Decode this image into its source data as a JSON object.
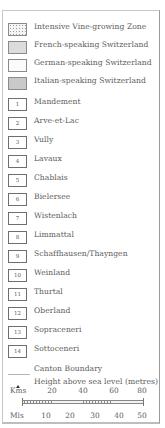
{
  "legend": {
    "zones": [
      {
        "label": "Intensive Vine-growing Zone",
        "style": "dotted"
      },
      {
        "label": "French-speaking Switzerland",
        "style": "french"
      },
      {
        "label": "German-speaking Switzerland",
        "style": "german"
      },
      {
        "label": "Italian-speaking Switzerland",
        "style": "italian"
      }
    ],
    "regions": [
      {
        "number": "1",
        "label": "Mandement"
      },
      {
        "number": "2",
        "label": "Arve-et-Lac"
      },
      {
        "number": "3",
        "label": "Vully"
      },
      {
        "number": "4",
        "label": "Lavaux"
      },
      {
        "number": "5",
        "label": "Chablais"
      },
      {
        "number": "6",
        "label": "Bielersee"
      },
      {
        "number": "7",
        "label": "Wistenlach"
      },
      {
        "number": "8",
        "label": "Limmattal"
      },
      {
        "number": "9",
        "label": "Schaffhausen/Thayngen"
      },
      {
        "number": "10",
        "label": "Weinland"
      },
      {
        "number": "11",
        "label": "Thurtal"
      },
      {
        "number": "12",
        "label": "Oberland"
      },
      {
        "number": "13",
        "label": "Sopraceneri"
      },
      {
        "number": "14",
        "label": "Sottoceneri"
      }
    ],
    "symbols": {
      "canton_boundary": "Canton Boundary",
      "height": "Height above sea level (metres)"
    },
    "scale": {
      "kms_label": "Kms",
      "kms_ticks": [
        "20",
        "40",
        "60",
        "80"
      ],
      "mls_label": "Mls",
      "mls_ticks": [
        "10",
        "20",
        "30",
        "40",
        "50"
      ]
    }
  },
  "colors": {
    "french": "#dcdcdc",
    "german": "#fbfbfb",
    "italian": "#c9c9c9",
    "border": "#8a8a8a",
    "text": "#5c5c5c"
  }
}
